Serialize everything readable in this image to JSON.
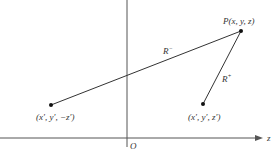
{
  "diagram": {
    "axis_z_label": "z",
    "origin_label": "O",
    "points": {
      "field_point": {
        "label": "P(x, y, z)"
      },
      "image_source": {
        "label": "(x′, y′, −z′)"
      },
      "source": {
        "label": "(x′, y′, z′)"
      }
    },
    "segments": {
      "r_minus": {
        "label_base": "R",
        "label_sup": "−"
      },
      "r_plus": {
        "label_base": "R",
        "label_sup": "+"
      }
    },
    "colors": {
      "axis": "#555555",
      "line": "#333333",
      "point": "#111111",
      "text": "#333333"
    }
  }
}
